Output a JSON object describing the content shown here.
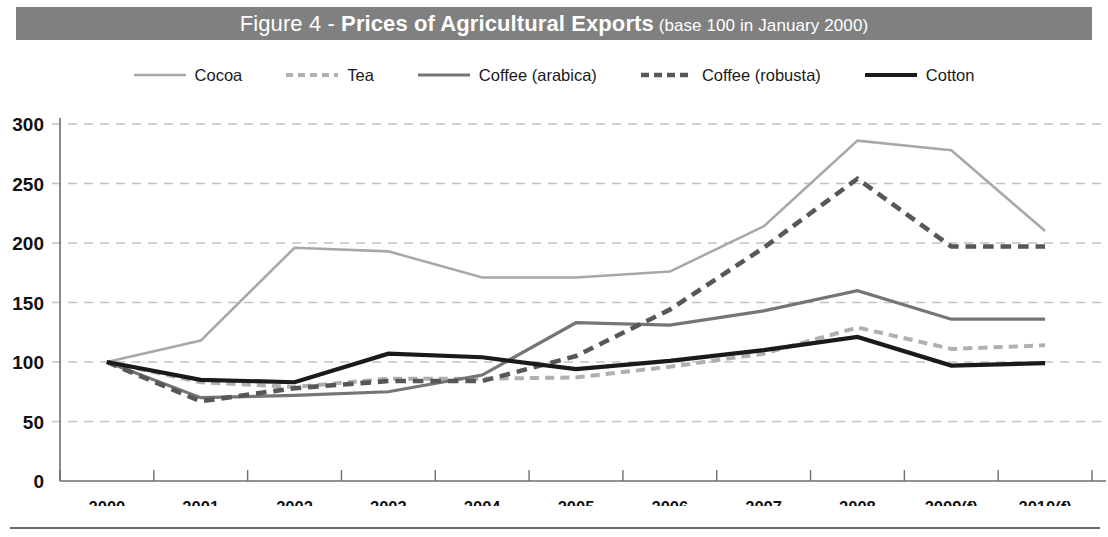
{
  "title": {
    "figure_label": "Figure 4 - ",
    "main": "Prices of Agricultural Exports",
    "subtitle": " (base 100 in January 2000)",
    "banner_color": "#808080",
    "text_color": "#ffffff"
  },
  "legend": {
    "position": "top-center",
    "items": [
      {
        "label": "Cocoa",
        "color": "#a8a8a8",
        "style": "solid",
        "width": 2.6,
        "icon": "line-swatch-icon"
      },
      {
        "label": "Tea",
        "color": "#b0b0b0",
        "style": "dashed",
        "width": 4.0,
        "icon": "dashed-line-swatch-icon"
      },
      {
        "label": "Coffee (arabica)",
        "color": "#757575",
        "style": "solid",
        "width": 3.2,
        "icon": "line-swatch-icon"
      },
      {
        "label": "Coffee (robusta)",
        "color": "#575757",
        "style": "dashed",
        "width": 4.6,
        "icon": "dashed-line-swatch-icon"
      },
      {
        "label": "Cotton",
        "color": "#1a1a1a",
        "style": "solid",
        "width": 4.2,
        "icon": "line-swatch-icon"
      }
    ]
  },
  "chart_data": {
    "type": "line",
    "title": "Figure 4 - Prices of Agricultural Exports (base 100 in January 2000)",
    "xlabel": "",
    "ylabel": "",
    "ylim": [
      0,
      300
    ],
    "yticks": [
      0,
      50,
      100,
      150,
      200,
      250,
      300
    ],
    "grid": true,
    "legend_position": "top-center",
    "categories": [
      "2000",
      "2001",
      "2002",
      "2003",
      "2004",
      "2005",
      "2006",
      "2007",
      "2008",
      "2009(f)",
      "2010(f)"
    ],
    "series": [
      {
        "name": "Cocoa",
        "color": "#a8a8a8",
        "style": "solid",
        "width": 2.6,
        "values": [
          100,
          118,
          196,
          193,
          171,
          171,
          176,
          214,
          286,
          278,
          210
        ]
      },
      {
        "name": "Tea",
        "color": "#b0b0b0",
        "style": "dashed",
        "width": 4.0,
        "values": [
          100,
          83,
          79,
          86,
          86,
          87,
          96,
          107,
          129,
          111,
          114
        ]
      },
      {
        "name": "Coffee (arabica)",
        "color": "#757575",
        "style": "solid",
        "width": 3.2,
        "values": [
          100,
          70,
          72,
          75,
          89,
          133,
          131,
          143,
          160,
          136,
          136
        ]
      },
      {
        "name": "Coffee (robusta)",
        "color": "#575757",
        "style": "dashed",
        "width": 4.6,
        "values": [
          100,
          67,
          78,
          84,
          84,
          105,
          144,
          196,
          254,
          197,
          197
        ]
      },
      {
        "name": "Cotton",
        "color": "#1a1a1a",
        "style": "solid",
        "width": 4.2,
        "values": [
          100,
          85,
          83,
          107,
          104,
          94,
          101,
          110,
          121,
          97,
          99
        ]
      }
    ]
  }
}
